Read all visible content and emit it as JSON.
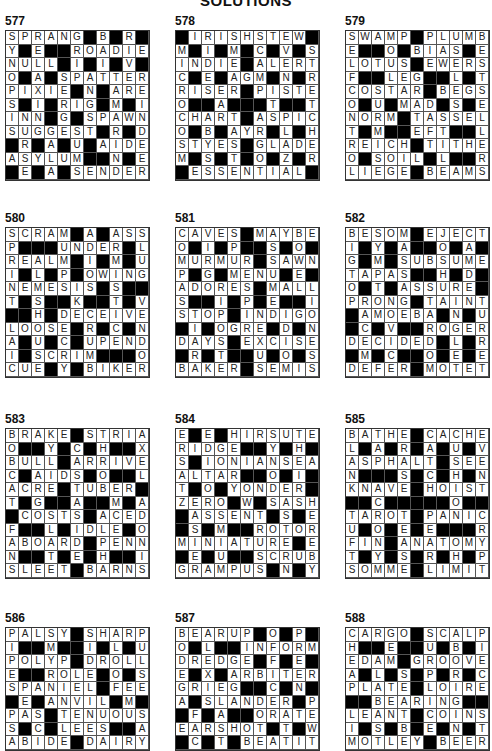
{
  "title": "SOLUTIONS",
  "puzzles": [
    {
      "number": "577",
      "pos": [
        5,
        14
      ],
      "rows": [
        "SPRANG#B#R#",
        "Y#E##ROADIE",
        "NULL#I#I#V#",
        "O#A#SPATTER",
        "PIXIE#N#ARE",
        "S#I#RIG#M#I",
        "INN#G#SPAWN",
        "SUGGEST#R#D",
        "#R#A#U#AIDE",
        "ASYLUM##N#E",
        "#E#A#SENDER"
      ]
    },
    {
      "number": "578",
      "pos": [
        175,
        14
      ],
      "rows": [
        "#IRISHSTEW#",
        "M#I#M#C#V#S",
        "INDIE#ALERT",
        "C#E#AGM#N#R",
        "RISER#PISTE",
        "O##A###T##T",
        "CHART#ASPIC",
        "O#B#AYR#L#H",
        "STYES#GLADE",
        "M#S#T#O#Z#R",
        "#ESSENTIAL#"
      ]
    },
    {
      "number": "579",
      "pos": [
        345,
        14
      ],
      "rows": [
        "SWAMP#PLUMB",
        "E##O#BIAS#E",
        "LOTUS#EWERS",
        "F##LEG##L#T",
        "COSTAR#BEGS",
        "O#U#MAD#S#E",
        "NORM#TASSEL",
        "T#M##EFT##L",
        "REICH#TITHE",
        "O#SOIL#L##R",
        "LIEGE#BEAMS"
      ]
    },
    {
      "number": "580",
      "pos": [
        5,
        211
      ],
      "rows": [
        "SCRAM#A#ASS",
        "P###UNDER#L",
        "REALM#I#M#U",
        "I#L#P#OWING",
        "NEMESIS#S##",
        "T#S##K##T#V",
        "##H#DECEIVE",
        "LOOSE#R#C#N",
        "A#U#C#UPEND",
        "I#SCRIM###O",
        "CUE#Y#BIKER"
      ]
    },
    {
      "number": "581",
      "pos": [
        175,
        211
      ],
      "rows": [
        "CAVES#MAYBE",
        "O#I#P##S#O#",
        "MURMUR#SAWN",
        "P#G#MENU#E#",
        "ADORES#MALL",
        "S##I#P#E##I",
        "STOP#INDIGO",
        "#I#OGRE#D#N",
        "DAYS#EXCISE",
        "#R#T##U#O#S",
        "BAKER#SEMIS"
      ]
    },
    {
      "number": "582",
      "pos": [
        345,
        211
      ],
      "rows": [
        "BESOM#EJECT",
        "I#Y#A##O#A#",
        "G#M#SUBSUME",
        "TAPAS##H#D#",
        "O#T#ASSURE#",
        "PRONG#TAINT",
        "#AMOEBA#N#U",
        "#C#V##ROGER",
        "DECIDED#L#R",
        "#M#C##O#E#E",
        "DEFER#MOTET"
      ]
    },
    {
      "number": "583",
      "pos": [
        5,
        412
      ],
      "rows": [
        "BRAKE#STRIA",
        "O##Y#C#H##X",
        "BULL#ARRIVE",
        "C#AIDS#O##L",
        "ACRE#TUBER#",
        "T#G##A##M#A",
        "#COSTS#ACED",
        "F##L#IDLE#O",
        "ABOARD#PENN",
        "N##T#E#H##I",
        "SLEET#BARNS"
      ]
    },
    {
      "number": "584",
      "pos": [
        175,
        412
      ],
      "rows": [
        "E#E#HIRSUTE",
        "RIDGE##Y#H#",
        "S#IONIANSEA",
        "ALTAR##O#I#",
        "T#O#YONDER#",
        "ZERO#W#SASH",
        "#ASSENT#S#E",
        "#S#M##ROTOR",
        "MINIATURE#E",
        "#E#U##SCRUB",
        "GRAMPUS#N#Y"
      ]
    },
    {
      "number": "585",
      "pos": [
        345,
        412
      ],
      "rows": [
        "BATHE#CACHE",
        "L#A#R#A#U#V",
        "ASPHALT#SEE",
        "N###S#C#H#N",
        "KNAVE#HOIST",
        "##C#####O##",
        "TAROT#PANIC",
        "U#O#E#E###R",
        "FIN#ANATOMY",
        "T#Y#S#R#H#P",
        "SOMME#LIMIT"
      ]
    },
    {
      "number": "586",
      "pos": [
        5,
        611
      ],
      "rows": [
        "PALSY#SHARP",
        "I##M##I#L#U",
        "POLYP#DROLL",
        "E##ROLE#O#S",
        "SPANIEL#FEE",
        "#E#ANVIL#M#",
        "PAS#TENUOUS",
        "S#C#LEES##A",
        "ABIDE#DAIRY"
      ]
    },
    {
      "number": "587",
      "pos": [
        175,
        611
      ],
      "rows": [
        "BEARUP#O#P#",
        "O#L##INFORM",
        "DREDGE#F#E#",
        "E#X#ARBITER",
        "GRIEG##C#N#",
        "A#SLANDER#P",
        "#F#A##ORATE",
        "EARSHOT#T#W",
        "#C#T#BEATIT"
      ]
    },
    {
      "number": "588",
      "pos": [
        345,
        611
      ],
      "rows": [
        "CARGO#SCALP",
        "H##E##U#B#I",
        "EDAM#GROOVE",
        "A#L#S#P#R#C",
        "PLATE#LOIRE",
        "##BEARING##",
        "LEANT#COINS",
        "I#S#B#E#N#T",
        "MOTLEY#BEER"
      ]
    }
  ]
}
